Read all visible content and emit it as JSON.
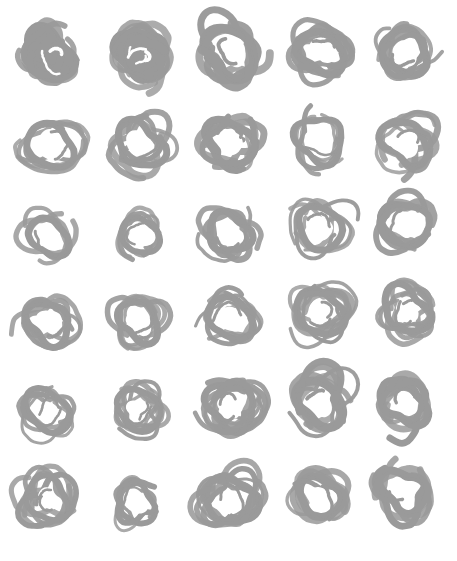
{
  "page": {
    "width": 457,
    "height": 561,
    "background_color": "#ffffff",
    "ink_color": "#9a9a9a",
    "medium": "marker-scribble"
  },
  "grid": {
    "columns": 5,
    "rows": 6,
    "total_cells": 30,
    "column_centers_x": [
      50,
      141,
      231,
      321,
      405
    ],
    "row_centers_y": [
      55,
      146,
      234,
      322,
      409,
      497
    ]
  },
  "chart_data": {
    "type": "scatter",
    "xlabel": "",
    "ylabel": "",
    "grid": false,
    "legend": "none",
    "xlim": [
      0,
      457
    ],
    "ylim": [
      0,
      561
    ],
    "categories": [
      "col-1",
      "col-2",
      "col-3",
      "col-4",
      "col-5"
    ],
    "series": [
      {
        "name": "row-1",
        "values": [
          1.0,
          0.9,
          0.45,
          0.4,
          0.4
        ],
        "note": "fill density: 1.0 = solid blob, 0 = thin open ring"
      },
      {
        "name": "row-2",
        "values": [
          0.35,
          0.4,
          0.45,
          0.3,
          0.35
        ]
      },
      {
        "name": "row-3",
        "values": [
          0.2,
          0.25,
          0.3,
          0.25,
          0.3
        ]
      },
      {
        "name": "row-4",
        "values": [
          0.3,
          0.35,
          0.35,
          0.45,
          0.4
        ]
      },
      {
        "name": "row-5",
        "values": [
          0.35,
          0.4,
          0.5,
          0.4,
          0.35
        ]
      },
      {
        "name": "row-6",
        "values": [
          0.35,
          0.2,
          0.45,
          0.4,
          0.25
        ]
      }
    ]
  },
  "glyphs": [
    {
      "id": "glyph-r1c1",
      "row": 1,
      "col": 1,
      "cx": 50,
      "cy": 55,
      "rx": 26,
      "ry": 26,
      "style": "solid-blob",
      "loops": 9,
      "stroke": 10,
      "seed": 11,
      "label": "filled scribble blob"
    },
    {
      "id": "glyph-r1c2",
      "row": 1,
      "col": 2,
      "cx": 141,
      "cy": 54,
      "rx": 27,
      "ry": 26,
      "style": "dense-fill",
      "loops": 8,
      "stroke": 9,
      "seed": 23,
      "label": "dense scribble blob"
    },
    {
      "id": "glyph-r1c3",
      "row": 1,
      "col": 3,
      "cx": 231,
      "cy": 52,
      "rx": 29,
      "ry": 28,
      "style": "thick-ring",
      "loops": 5,
      "stroke": 9,
      "seed": 37,
      "label": "thick scribbled ring"
    },
    {
      "id": "glyph-r1c4",
      "row": 1,
      "col": 4,
      "cx": 321,
      "cy": 52,
      "rx": 26,
      "ry": 25,
      "style": "thick-ring",
      "loops": 5,
      "stroke": 8,
      "seed": 41,
      "label": "thick scribbled ring"
    },
    {
      "id": "glyph-r1c5",
      "row": 1,
      "col": 5,
      "cx": 405,
      "cy": 52,
      "rx": 26,
      "ry": 26,
      "style": "thick-ring",
      "loops": 5,
      "stroke": 8,
      "seed": 53,
      "label": "thick scribbled ring"
    },
    {
      "id": "glyph-r2c1",
      "row": 2,
      "col": 1,
      "cx": 50,
      "cy": 146,
      "rx": 27,
      "ry": 24,
      "style": "open-ring",
      "loops": 4,
      "stroke": 7,
      "seed": 61,
      "label": "open scribbled ring"
    },
    {
      "id": "glyph-r2c2",
      "row": 2,
      "col": 2,
      "cx": 140,
      "cy": 145,
      "rx": 26,
      "ry": 25,
      "style": "open-ring",
      "loops": 5,
      "stroke": 7,
      "seed": 71,
      "label": "open scribbled ring"
    },
    {
      "id": "glyph-r2c3",
      "row": 2,
      "col": 3,
      "cx": 230,
      "cy": 143,
      "rx": 27,
      "ry": 26,
      "style": "thick-ring",
      "loops": 5,
      "stroke": 8,
      "seed": 83,
      "label": "thick scribbled ring"
    },
    {
      "id": "glyph-r2c4",
      "row": 2,
      "col": 4,
      "cx": 320,
      "cy": 140,
      "rx": 26,
      "ry": 26,
      "style": "open-ring",
      "loops": 4,
      "stroke": 6,
      "seed": 97,
      "label": "open scribbled ring"
    },
    {
      "id": "glyph-r2c5",
      "row": 2,
      "col": 5,
      "cx": 405,
      "cy": 142,
      "rx": 25,
      "ry": 25,
      "style": "open-ring",
      "loops": 5,
      "stroke": 7,
      "seed": 103,
      "label": "open scribbled ring"
    },
    {
      "id": "glyph-r3c1",
      "row": 3,
      "col": 1,
      "cx": 49,
      "cy": 237,
      "rx": 22,
      "ry": 22,
      "style": "thin-ring",
      "loops": 3,
      "stroke": 7,
      "seed": 113,
      "label": "thin ring"
    },
    {
      "id": "glyph-r3c2",
      "row": 3,
      "col": 2,
      "cx": 140,
      "cy": 236,
      "rx": 21,
      "ry": 21,
      "style": "thin-ring",
      "loops": 4,
      "stroke": 6,
      "seed": 127,
      "label": "thin ring"
    },
    {
      "id": "glyph-r3c3",
      "row": 3,
      "col": 3,
      "cx": 229,
      "cy": 233,
      "rx": 24,
      "ry": 23,
      "style": "open-ring",
      "loops": 4,
      "stroke": 7,
      "seed": 131,
      "label": "open scribbled ring"
    },
    {
      "id": "glyph-r3c4",
      "row": 3,
      "col": 4,
      "cx": 320,
      "cy": 228,
      "rx": 25,
      "ry": 25,
      "style": "open-ring",
      "loops": 4,
      "stroke": 7,
      "seed": 149,
      "label": "open scribbled ring"
    },
    {
      "id": "glyph-r3c5",
      "row": 3,
      "col": 5,
      "cx": 406,
      "cy": 224,
      "rx": 26,
      "ry": 25,
      "style": "open-ring",
      "loops": 5,
      "stroke": 7,
      "seed": 151,
      "label": "open scribbled ring"
    },
    {
      "id": "glyph-r4c1",
      "row": 4,
      "col": 1,
      "cx": 49,
      "cy": 323,
      "rx": 24,
      "ry": 24,
      "style": "open-ring",
      "loops": 4,
      "stroke": 7,
      "seed": 163,
      "label": "open scribbled ring"
    },
    {
      "id": "glyph-r4c2",
      "row": 4,
      "col": 2,
      "cx": 139,
      "cy": 321,
      "rx": 23,
      "ry": 23,
      "style": "open-ring",
      "loops": 5,
      "stroke": 7,
      "seed": 173,
      "label": "open scribbled ring"
    },
    {
      "id": "glyph-r4c3",
      "row": 4,
      "col": 3,
      "cx": 230,
      "cy": 318,
      "rx": 25,
      "ry": 24,
      "style": "open-ring",
      "loops": 5,
      "stroke": 7,
      "seed": 181,
      "label": "open scribbled ring"
    },
    {
      "id": "glyph-r4c4",
      "row": 4,
      "col": 4,
      "cx": 320,
      "cy": 313,
      "rx": 26,
      "ry": 26,
      "style": "multi-loop",
      "loops": 7,
      "stroke": 7,
      "seed": 191,
      "label": "multi-loop scribbled ring"
    },
    {
      "id": "glyph-r4c5",
      "row": 4,
      "col": 5,
      "cx": 406,
      "cy": 310,
      "rx": 26,
      "ry": 25,
      "style": "multi-loop",
      "loops": 6,
      "stroke": 7,
      "seed": 199,
      "label": "multi-loop scribbled ring"
    },
    {
      "id": "glyph-r5c1",
      "row": 5,
      "col": 1,
      "cx": 48,
      "cy": 411,
      "rx": 24,
      "ry": 24,
      "style": "multi-loop",
      "loops": 6,
      "stroke": 6,
      "seed": 211,
      "label": "multi-loop scribbled ring"
    },
    {
      "id": "glyph-r5c2",
      "row": 5,
      "col": 2,
      "cx": 139,
      "cy": 410,
      "rx": 25,
      "ry": 23,
      "style": "multi-loop",
      "loops": 6,
      "stroke": 6,
      "seed": 223,
      "label": "multi-loop scribbled ring"
    },
    {
      "id": "glyph-r5c3",
      "row": 5,
      "col": 3,
      "cx": 231,
      "cy": 406,
      "rx": 27,
      "ry": 26,
      "style": "multi-loop",
      "loops": 8,
      "stroke": 7,
      "seed": 227,
      "label": "dense multi-loop ring"
    },
    {
      "id": "glyph-r5c4",
      "row": 5,
      "col": 4,
      "cx": 320,
      "cy": 403,
      "rx": 27,
      "ry": 26,
      "style": "thick-ring",
      "loops": 5,
      "stroke": 9,
      "seed": 233,
      "label": "thick scribbled ring"
    },
    {
      "id": "glyph-r5c5",
      "row": 5,
      "col": 5,
      "cx": 405,
      "cy": 404,
      "rx": 24,
      "ry": 24,
      "style": "thick-ring",
      "loops": 4,
      "stroke": 8,
      "seed": 239,
      "label": "thick scribbled ring"
    },
    {
      "id": "glyph-r6c1",
      "row": 6,
      "col": 1,
      "cx": 47,
      "cy": 499,
      "rx": 24,
      "ry": 24,
      "style": "multi-loop",
      "loops": 6,
      "stroke": 6,
      "seed": 251,
      "label": "multi-loop scribbled ring"
    },
    {
      "id": "glyph-r6c2",
      "row": 6,
      "col": 2,
      "cx": 136,
      "cy": 503,
      "rx": 21,
      "ry": 23,
      "style": "thin-ring",
      "loops": 3,
      "stroke": 6,
      "seed": 257,
      "label": "thin ring"
    },
    {
      "id": "glyph-r6c3",
      "row": 6,
      "col": 3,
      "cx": 231,
      "cy": 501,
      "rx": 28,
      "ry": 27,
      "style": "multi-loop",
      "loops": 7,
      "stroke": 7,
      "seed": 263,
      "label": "dense multi-loop ring"
    },
    {
      "id": "glyph-r6c4",
      "row": 6,
      "col": 4,
      "cx": 320,
      "cy": 497,
      "rx": 24,
      "ry": 24,
      "style": "open-ring",
      "loops": 5,
      "stroke": 8,
      "seed": 269,
      "label": "open scribbled ring"
    },
    {
      "id": "glyph-r6c5",
      "row": 6,
      "col": 5,
      "cx": 404,
      "cy": 491,
      "rx": 24,
      "ry": 25,
      "style": "thick-ring",
      "loops": 4,
      "stroke": 8,
      "seed": 277,
      "label": "thick scribbled ring"
    }
  ]
}
